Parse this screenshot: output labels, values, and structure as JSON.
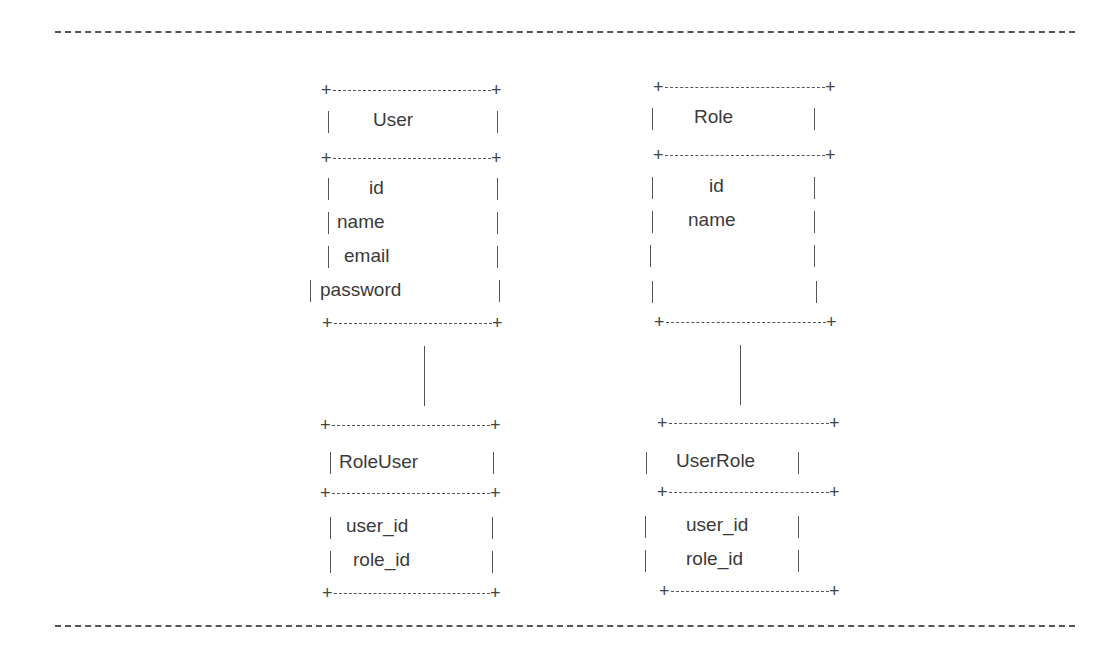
{
  "diagram": {
    "title": "",
    "entities": [
      {
        "name": "User",
        "fields": [
          "id",
          "name",
          "email",
          "password"
        ]
      },
      {
        "name": "Role",
        "fields": [
          "id",
          "name"
        ]
      },
      {
        "name": "RoleUser",
        "fields": [
          "user_id",
          "role_id"
        ]
      },
      {
        "name": "UserRole",
        "fields": [
          "user_id",
          "role_id"
        ]
      }
    ],
    "connections": [
      {
        "from": "User",
        "to": "RoleUser"
      },
      {
        "from": "Role",
        "to": "UserRole"
      }
    ]
  }
}
